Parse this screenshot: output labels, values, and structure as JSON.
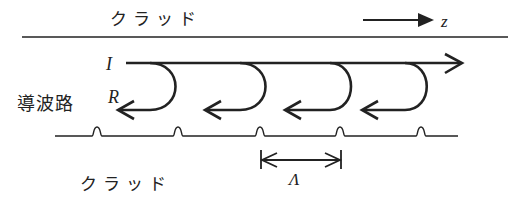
{
  "labels": {
    "cladding_top": "クラッド",
    "cladding_bottom": "クラッド",
    "waveguide": "導波路",
    "incident": "I",
    "reflected": "R",
    "direction": "z",
    "period": "Λ"
  },
  "diagram": {
    "type": "waveguide-bragg-grating-schematic",
    "reflection_loops": 4,
    "grating_bumps": 5,
    "colors": {
      "ink": "#222222",
      "background": "#ffffff"
    }
  }
}
